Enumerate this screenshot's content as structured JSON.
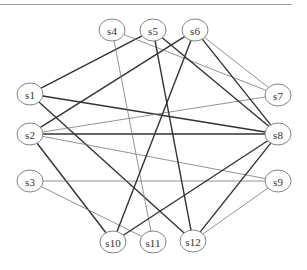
{
  "diagram": {
    "nodes": [
      {
        "id": "s1",
        "label": "s1",
        "x": 30,
        "y": 94
      },
      {
        "id": "s2",
        "label": "s2",
        "x": 30,
        "y": 134
      },
      {
        "id": "s3",
        "label": "s3",
        "x": 30,
        "y": 181
      },
      {
        "id": "s4",
        "label": "s4",
        "x": 112,
        "y": 30
      },
      {
        "id": "s5",
        "label": "s5",
        "x": 153,
        "y": 30
      },
      {
        "id": "s6",
        "label": "s6",
        "x": 195,
        "y": 30
      },
      {
        "id": "s7",
        "label": "s7",
        "x": 278,
        "y": 95
      },
      {
        "id": "s8",
        "label": "s8",
        "x": 278,
        "y": 134
      },
      {
        "id": "s9",
        "label": "s9",
        "x": 278,
        "y": 181
      },
      {
        "id": "s10",
        "label": "s10",
        "x": 113,
        "y": 242
      },
      {
        "id": "s11",
        "label": "s11",
        "x": 153,
        "y": 242
      },
      {
        "id": "s12",
        "label": "s12",
        "x": 193,
        "y": 241
      }
    ],
    "edges": [
      {
        "from": "s1",
        "to": "s5",
        "weight": "thick"
      },
      {
        "from": "s1",
        "to": "s8",
        "weight": "thick"
      },
      {
        "from": "s1",
        "to": "s12",
        "weight": "thick"
      },
      {
        "from": "s2",
        "to": "s6",
        "weight": "thick"
      },
      {
        "from": "s2",
        "to": "s7",
        "weight": "thin"
      },
      {
        "from": "s2",
        "to": "s8",
        "weight": "thick"
      },
      {
        "from": "s2",
        "to": "s9",
        "weight": "thin"
      },
      {
        "from": "s2",
        "to": "s10",
        "weight": "thick"
      },
      {
        "from": "s3",
        "to": "s9",
        "weight": "thin"
      },
      {
        "from": "s3",
        "to": "s11",
        "weight": "thin"
      },
      {
        "from": "s4",
        "to": "s7",
        "weight": "thin"
      },
      {
        "from": "s4",
        "to": "s11",
        "weight": "thin"
      },
      {
        "from": "s5",
        "to": "s8",
        "weight": "thick"
      },
      {
        "from": "s5",
        "to": "s12",
        "weight": "thick"
      },
      {
        "from": "s6",
        "to": "s7",
        "weight": "thin"
      },
      {
        "from": "s6",
        "to": "s8",
        "weight": "thick"
      },
      {
        "from": "s6",
        "to": "s10",
        "weight": "thick"
      },
      {
        "from": "s8",
        "to": "s10",
        "weight": "thick"
      },
      {
        "from": "s8",
        "to": "s12",
        "weight": "thick"
      },
      {
        "from": "s9",
        "to": "s12",
        "weight": "thin"
      }
    ]
  }
}
